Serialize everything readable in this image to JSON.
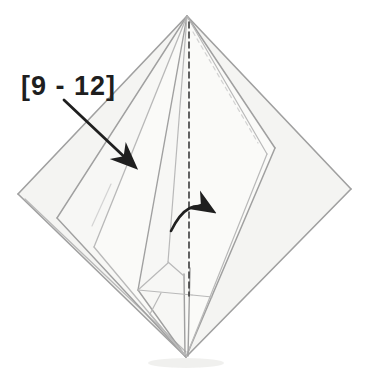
{
  "annotation": {
    "label": "[9 - 12]"
  },
  "colors": {
    "edge": "#a0a0a0",
    "edge_light": "#b9b9b9",
    "faint": "#d3d3d3",
    "dash_dark": "#3c3c3c",
    "annotation": "#1f1f1f",
    "paper_base": "#f4f4f2",
    "paper_mid": "#f7f7f5",
    "paper_top": "#fafaf8",
    "shadow": "#e3e3e0"
  },
  "figure": {
    "type": "origami-fold-step-diagram",
    "viewbox": "0 0 368 374",
    "vertices": {
      "top": [
        187,
        16
      ],
      "left": [
        18,
        194
      ],
      "right": [
        351,
        189
      ],
      "bottom": [
        186,
        357
      ]
    },
    "polygons": [
      {
        "name": "paper-sheet",
        "points": "187,16 351,189 186,357 18,194",
        "fill": "paper_base"
      },
      {
        "name": "left-flap",
        "points": "187,16 57,218 186,357",
        "fill": "paper_mid"
      },
      {
        "name": "middle-flap",
        "points": "187,16 94,247 186,357",
        "fill": "paper_top"
      },
      {
        "name": "inner-flap",
        "points": "187,16 138,290 186,357",
        "fill": "paper_mid"
      },
      {
        "name": "right-flap",
        "points": "187,16 275,148 186,357",
        "fill": "paper_top"
      }
    ],
    "lines": [
      {
        "name": "edge-top-left",
        "x1": 187,
        "y1": 16,
        "x2": 18,
        "y2": 194,
        "stroke": "edge",
        "w": 1.6
      },
      {
        "name": "edge-bottom-left",
        "x1": 18,
        "y1": 194,
        "x2": 186,
        "y2": 357,
        "stroke": "edge",
        "w": 1.6
      },
      {
        "name": "edge-bottom-left-layer",
        "x1": 25,
        "y1": 199,
        "x2": 186,
        "y2": 352,
        "stroke": "edge_light",
        "w": 1.3
      },
      {
        "name": "edge-top-right",
        "x1": 187,
        "y1": 16,
        "x2": 351,
        "y2": 189,
        "stroke": "edge",
        "w": 1.6
      },
      {
        "name": "edge-bottom-right",
        "x1": 351,
        "y1": 189,
        "x2": 186,
        "y2": 357,
        "stroke": "edge",
        "w": 1.6
      },
      {
        "name": "left-flap-edge",
        "x1": 187,
        "y1": 16,
        "x2": 57,
        "y2": 218,
        "stroke": "edge",
        "w": 1.4
      },
      {
        "name": "left-flap-edge",
        "x1": 57,
        "y1": 218,
        "x2": 186,
        "y2": 357,
        "stroke": "edge",
        "w": 1.4
      },
      {
        "name": "middle-flap-edge",
        "x1": 187,
        "y1": 16,
        "x2": 94,
        "y2": 247,
        "stroke": "edge_light",
        "w": 1.3
      },
      {
        "name": "middle-flap-edge",
        "x1": 94,
        "y1": 247,
        "x2": 186,
        "y2": 357,
        "stroke": "edge_light",
        "w": 1.3
      },
      {
        "name": "inner-flap-edge",
        "x1": 187,
        "y1": 16,
        "x2": 138,
        "y2": 290,
        "stroke": "edge",
        "w": 1.4
      },
      {
        "name": "inner-flap-edge",
        "x1": 138,
        "y1": 290,
        "x2": 186,
        "y2": 357,
        "stroke": "edge",
        "w": 1.4
      },
      {
        "name": "strip-fan-edge",
        "x1": 187,
        "y1": 16,
        "x2": 168,
        "y2": 262,
        "stroke": "edge_light",
        "w": 1.2
      },
      {
        "name": "right-flap-edge",
        "x1": 187,
        "y1": 16,
        "x2": 275,
        "y2": 148,
        "stroke": "edge",
        "w": 1.5
      },
      {
        "name": "right-flap-edge",
        "x1": 275,
        "y1": 148,
        "x2": 186,
        "y2": 357,
        "stroke": "edge",
        "w": 1.5
      },
      {
        "name": "right-flap-layer-edge",
        "x1": 187,
        "y1": 16,
        "x2": 267,
        "y2": 154,
        "stroke": "edge_light",
        "w": 1.2
      },
      {
        "name": "right-flap-layer-edge",
        "x1": 267,
        "y1": 154,
        "x2": 186,
        "y2": 357,
        "stroke": "edge_light",
        "w": 1.2
      },
      {
        "name": "strip-edge",
        "x1": 184,
        "y1": 274,
        "x2": 185,
        "y2": 356,
        "stroke": "edge",
        "w": 1.4
      },
      {
        "name": "strip-edge",
        "x1": 190,
        "y1": 268,
        "x2": 188,
        "y2": 356,
        "stroke": "edge",
        "w": 1.4
      },
      {
        "name": "facet-edge",
        "x1": 168,
        "y1": 262,
        "x2": 184,
        "y2": 276,
        "stroke": "edge_light",
        "w": 1.2
      },
      {
        "name": "facet-edge",
        "x1": 138,
        "y1": 290,
        "x2": 168,
        "y2": 263,
        "stroke": "edge_light",
        "w": 1.2
      },
      {
        "name": "facet-edge",
        "x1": 138,
        "y1": 290,
        "x2": 192,
        "y2": 295,
        "stroke": "edge_light",
        "w": 1.2
      },
      {
        "name": "facet-edge",
        "x1": 192,
        "y1": 295,
        "x2": 212,
        "y2": 297,
        "stroke": "edge_light",
        "w": 1.2
      },
      {
        "name": "facet-edge",
        "x1": 161,
        "y1": 293,
        "x2": 150,
        "y2": 314,
        "stroke": "edge_light",
        "w": 1.2
      },
      {
        "name": "facet-edge",
        "x1": 150,
        "y1": 314,
        "x2": 185,
        "y2": 355,
        "stroke": "edge_light",
        "w": 1.2
      },
      {
        "name": "crease-line",
        "x1": 111,
        "y1": 184,
        "x2": 92,
        "y2": 226,
        "stroke": "faint",
        "w": 1.2
      },
      {
        "name": "valley-fold-line",
        "x1": 189,
        "y1": 22,
        "x2": 189,
        "y2": 296,
        "stroke": "dash_dark",
        "w": 1.6,
        "dash": "6 4"
      },
      {
        "name": "hidden-fold-line",
        "x1": 193,
        "y1": 32,
        "x2": 258,
        "y2": 143,
        "stroke": "faint",
        "w": 1.2,
        "dash": "4 4"
      }
    ],
    "arrows": [
      {
        "name": "fold-pointer-arrow",
        "path": "M 64,100 L 133,165",
        "w": 2.8
      },
      {
        "name": "fold-over-arrow",
        "path": "M 171,231 Q 188,196 211,210",
        "w": 2.6
      }
    ],
    "shadow": {
      "cx": 186,
      "cy": 363,
      "rx": 38,
      "ry": 5
    }
  }
}
